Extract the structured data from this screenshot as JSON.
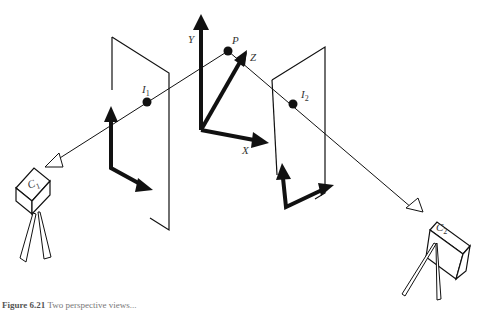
{
  "diagram": {
    "labels": {
      "world_y": "Y",
      "world_z": "Z",
      "world_x": "X",
      "point": "P",
      "image1_point": "I",
      "image1_sub": "1",
      "image2_point": "I",
      "image2_sub": "2",
      "camera1": "C",
      "camera1_sub": "1",
      "camera2": "C",
      "camera2_sub": "2"
    },
    "caption": {
      "prefix": "Figure 6.21",
      "text": "Two perspective views..."
    },
    "colors": {
      "stroke": "#111111",
      "background": "#ffffff"
    }
  }
}
